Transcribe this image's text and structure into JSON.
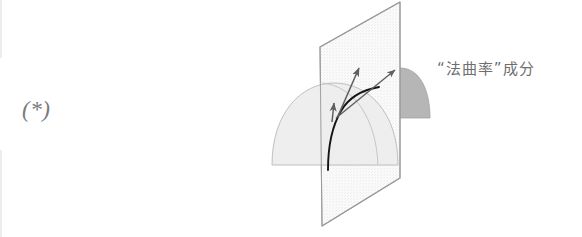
{
  "page": {
    "background_color": "#ffffff",
    "width": 582,
    "height": 237
  },
  "equation_tag": {
    "label": "(*)"
  },
  "caption": {
    "text": "“法曲率”成分",
    "meaning": "normal curvature component",
    "color": "#6e6e6e"
  },
  "figure": {
    "name": "normal-curvature-diagram",
    "colors": {
      "plane_fill": "#f4f4f4",
      "plane_stroke": "#9a9a9a",
      "surface_light_fill": "#e8e8e8",
      "surface_dark_fill": "#b8b8b8",
      "surface_stroke": "#b0b0b0",
      "curve_stroke": "#1a1a1a",
      "vector_stroke": "#6a6a6a"
    },
    "elements": [
      {
        "name": "normal-plane",
        "type": "quadrilateral",
        "label": "normal plane"
      },
      {
        "name": "dome-surface-light",
        "type": "dome",
        "label": "surface (front)"
      },
      {
        "name": "dome-surface-dark",
        "type": "dome",
        "label": "surface (behind plane)"
      },
      {
        "name": "surface-curve",
        "type": "curve",
        "label": "curve on surface"
      },
      {
        "name": "vector-normal",
        "type": "arrow",
        "label": "normal curvature vector"
      },
      {
        "name": "vector-curvature",
        "type": "arrow",
        "label": "curvature vector"
      },
      {
        "name": "vector-tangential",
        "type": "arrow",
        "label": "geodesic curvature vector"
      }
    ]
  }
}
